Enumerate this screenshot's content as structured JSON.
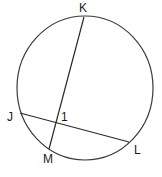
{
  "diagram": {
    "type": "circle-with-intersecting-chords",
    "circle": {
      "cx": 85,
      "cy": 88,
      "rx": 68,
      "ry": 72,
      "stroke": "#3a3a3a"
    },
    "points": {
      "K": {
        "x": 84,
        "y": 17,
        "label": "K",
        "lx": 79,
        "ly": 12
      },
      "J": {
        "x": 20,
        "y": 113,
        "label": "J",
        "lx": 7,
        "ly": 121
      },
      "L": {
        "x": 129,
        "y": 142,
        "label": "L",
        "lx": 134,
        "ly": 154
      },
      "M": {
        "x": 49,
        "y": 149,
        "label": "M",
        "lx": 43,
        "ly": 163
      }
    },
    "chords": [
      {
        "from": "K",
        "to": "M"
      },
      {
        "from": "J",
        "to": "L"
      }
    ],
    "angle_label": {
      "text": "1",
      "x": 61,
      "y": 121
    }
  }
}
